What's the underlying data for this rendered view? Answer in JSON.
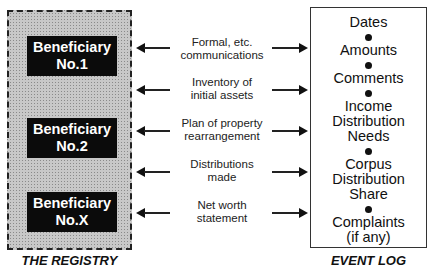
{
  "registry": {
    "caption": "THE REGISTRY",
    "beneficiaries": [
      {
        "line1": "Beneficiary",
        "line2": "No.1"
      },
      {
        "line1": "Beneficiary",
        "line2": "No.2"
      },
      {
        "line1": "Beneficiary",
        "line2": "No.X"
      }
    ]
  },
  "flows": [
    {
      "line1": "Formal, etc.",
      "line2": "communications"
    },
    {
      "line1": "Inventory of",
      "line2": "initial assets"
    },
    {
      "line1": "Plan of property",
      "line2": "rearrangement"
    },
    {
      "line1": "Distributions",
      "line2": "made"
    },
    {
      "line1": "Net worth",
      "line2": "statement"
    }
  ],
  "event_log": {
    "caption": "EVENT LOG",
    "items": [
      {
        "lines": [
          "Dates"
        ]
      },
      {
        "lines": [
          "Amounts"
        ]
      },
      {
        "lines": [
          "Comments"
        ]
      },
      {
        "lines": [
          "Income",
          "Distribution",
          "Needs"
        ]
      },
      {
        "lines": [
          "Corpus",
          "Distribution",
          "Share"
        ]
      },
      {
        "lines": [
          "Complaints",
          "(if any)"
        ]
      }
    ]
  }
}
